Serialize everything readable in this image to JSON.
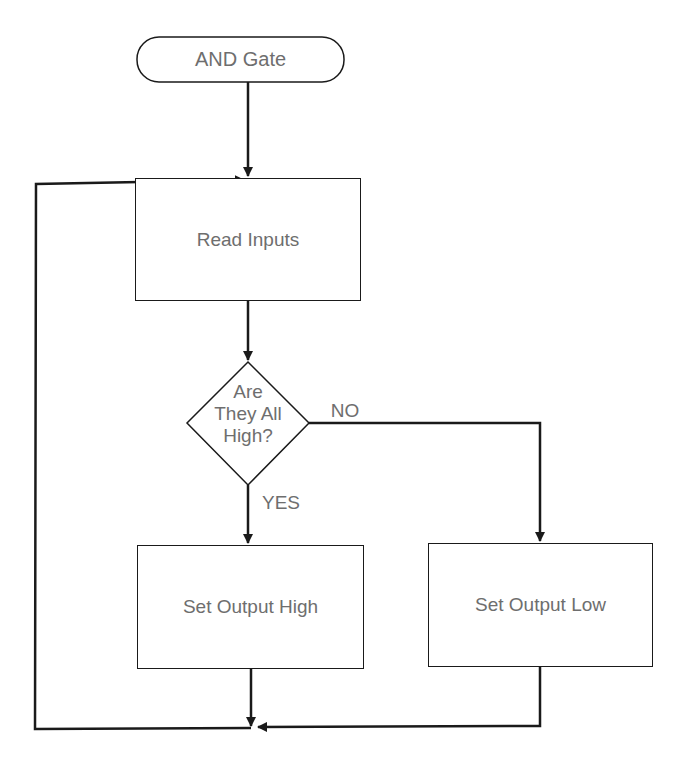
{
  "diagram": {
    "type": "flowchart",
    "nodes": {
      "start": {
        "label": "AND Gate",
        "shape": "terminator"
      },
      "read": {
        "label": "Read Inputs",
        "shape": "process"
      },
      "decision": {
        "line1": "Are",
        "line2": "They All",
        "line3": "High?",
        "shape": "decision"
      },
      "high": {
        "label": "Set Output High",
        "shape": "process"
      },
      "low": {
        "label": "Set Output Low",
        "shape": "process"
      }
    },
    "edges": {
      "no_label": "NO",
      "yes_label": "YES"
    },
    "colors": {
      "line": "#1a1a1a",
      "text": "#6e6e6e",
      "background": "#ffffff"
    }
  }
}
